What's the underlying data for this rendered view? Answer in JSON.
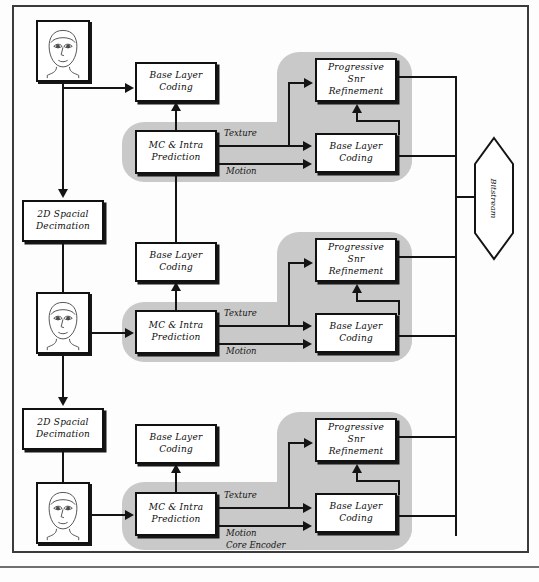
{
  "diagram": {
    "colors": {
      "blob_gray": "#c9c9c9",
      "stroke": "#141414",
      "box_fill": "#ffffff",
      "frame": "#3b3b3b"
    },
    "labels": {
      "base_layer_coding": "Base Layer\nCoding",
      "mc_intra_prediction": "MC & Intra\nPrediction",
      "progressive_snr_refinement": "Progressive\nSnr\nRefinement",
      "spatial_decimation": "2D Spacial\nDecimation",
      "texture": "Texture",
      "motion": "Motion",
      "core_encoder": "Core Encoder",
      "bitstream": "Bitstream"
    },
    "layers": [
      {
        "id": "layer-1",
        "base_layer_coding": "Base Layer Coding",
        "mc_intra_prediction": "MC & Intra Prediction",
        "progressive_snr_refinement": "Progressive Snr Refinement",
        "inner_base_layer_coding": "Base Layer Coding",
        "texture": "Texture",
        "motion": "Motion"
      },
      {
        "id": "layer-2",
        "base_layer_coding": "Base Layer Coding",
        "mc_intra_prediction": "MC & Intra Prediction",
        "progressive_snr_refinement": "Progressive Snr Refinement",
        "inner_base_layer_coding": "Base Layer Coding",
        "texture": "Texture",
        "motion": "Motion"
      },
      {
        "id": "layer-3",
        "base_layer_coding": "Base Layer Coding",
        "mc_intra_prediction": "MC & Intra Prediction",
        "progressive_snr_refinement": "Progressive Snr Refinement",
        "inner_base_layer_coding": "Base Layer Coding",
        "texture": "Texture",
        "motion": "Motion",
        "core_encoder": "Core Encoder"
      }
    ],
    "decimators": [
      {
        "id": "decimator-1",
        "label": "2D Spacial Decimation"
      },
      {
        "id": "decimator-2",
        "label": "2D Spacial Decimation"
      }
    ],
    "sources": [
      {
        "id": "source-frame-1",
        "alt": "face"
      },
      {
        "id": "source-frame-2",
        "alt": "face"
      },
      {
        "id": "source-frame-3",
        "alt": "face"
      }
    ],
    "output": {
      "label": "Bitstream"
    }
  }
}
